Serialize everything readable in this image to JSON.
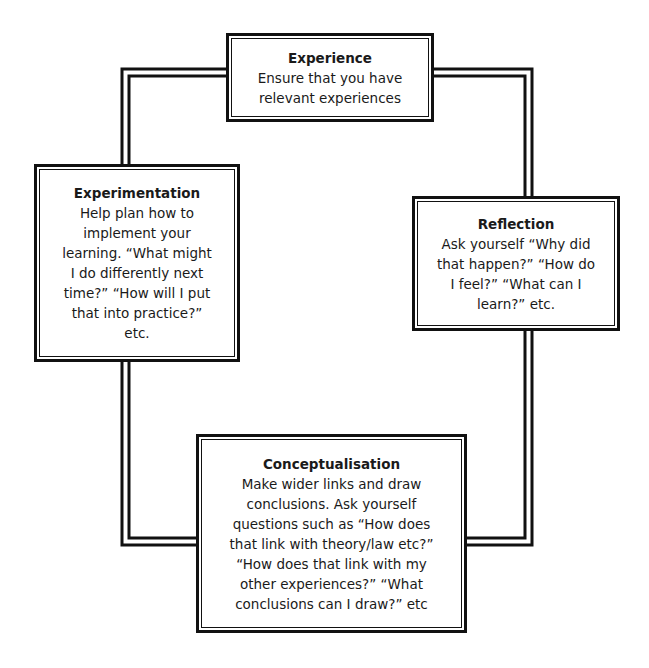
{
  "diagram": {
    "type": "cycle",
    "line_color": "#111111",
    "background": "#ffffff",
    "nodes": [
      {
        "id": "experience",
        "title": "Experience",
        "body": "Ensure that you have\nrelevant experiences"
      },
      {
        "id": "reflection",
        "title": "Reflection",
        "body": "Ask yourself “Why did\nthat happen?”  “How do\nI feel?” “What can I\nlearn?” etc."
      },
      {
        "id": "conceptualisation",
        "title": "Conceptualisation",
        "body": "Make wider links and draw\nconclusions.  Ask yourself\nquestions such as “How does\nthat link with theory/law etc?”\n“How does that link with my\nother experiences?”  “What\nconclusions can I draw?” etc"
      },
      {
        "id": "experimentation",
        "title": "Experimentation",
        "body": "Help plan how to\nimplement your\nlearning.  “What might\nI do differently next\ntime?”  “How will I put\nthat into practice?”\netc."
      }
    ],
    "edges": [
      {
        "from": "experience",
        "to": "reflection",
        "style": "double-line"
      },
      {
        "from": "reflection",
        "to": "conceptualisation",
        "style": "double-line"
      },
      {
        "from": "conceptualisation",
        "to": "experimentation",
        "style": "double-line"
      },
      {
        "from": "experimentation",
        "to": "experience",
        "style": "double-line"
      }
    ]
  }
}
